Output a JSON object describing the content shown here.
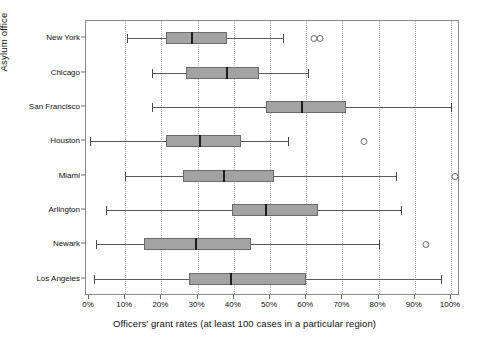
{
  "chart_data": {
    "type": "box",
    "title": "",
    "xlabel": "Officers' grant rates (at least 100 cases in a particular region)",
    "ylabel": "Asylum office",
    "xlim": [
      -2,
      105
    ],
    "xticks": [
      0,
      10,
      20,
      30,
      40,
      50,
      60,
      70,
      80,
      90,
      100
    ],
    "xtick_labels": [
      "0%",
      "10%",
      "20%",
      "30%",
      "40%",
      "50%",
      "60%",
      "70%",
      "80%",
      "90%",
      "100%"
    ],
    "categories": [
      "New York",
      "Chicago",
      "San Francisco",
      "Houston",
      "Miami",
      "Arlington",
      "Newark",
      "Los Angeles"
    ],
    "grid": "vertical-dotted",
    "legend": "none",
    "orientation": "horizontal",
    "units": "percent",
    "boxes": [
      {
        "category": "New York",
        "whisker_low": 10.5,
        "q1": 21.3,
        "median": 28.2,
        "q3": 38.1,
        "whisker_high": 53.6,
        "outliers": [
          62.0,
          63.5
        ]
      },
      {
        "category": "Chicago",
        "whisker_low": 17.4,
        "q1": 26.8,
        "median": 37.8,
        "q3": 47.0,
        "whisker_high": 60.5,
        "outliers": []
      },
      {
        "category": "San Francisco",
        "whisker_low": 17.4,
        "q1": 48.9,
        "median": 58.6,
        "q3": 71.0,
        "whisker_high": 100.0,
        "outliers": []
      },
      {
        "category": "Houston",
        "whisker_low": 0.3,
        "q1": 21.3,
        "median": 30.4,
        "q3": 42.0,
        "whisker_high": 55.0,
        "outliers": [
          75.7
        ]
      },
      {
        "category": "Miami",
        "whisker_low": 9.9,
        "q1": 26.0,
        "median": 37.0,
        "q3": 51.0,
        "whisker_high": 84.8,
        "outliers": [
          100.8
        ]
      },
      {
        "category": "Arlington",
        "whisker_low": 4.7,
        "q1": 39.5,
        "median": 48.6,
        "q3": 63.3,
        "whisker_high": 86.2,
        "outliers": []
      },
      {
        "category": "Newark",
        "whisker_low": 1.9,
        "q1": 15.2,
        "median": 29.3,
        "q3": 44.8,
        "whisker_high": 80.1,
        "outliers": [
          92.8
        ]
      },
      {
        "category": "Los Angeles",
        "whisker_low": 1.4,
        "q1": 27.6,
        "median": 39.0,
        "q3": 60.0,
        "whisker_high": 97.2,
        "outliers": []
      }
    ]
  },
  "colors": {
    "box_fill": "#a3a3a3",
    "box_edge": "#6b6b6b",
    "median": "#1e1e1e",
    "whisker": "#5a5a5a",
    "grid": "#b9b9b9",
    "frame": "#8a8a8a",
    "text": "#111111",
    "background": "#ffffff"
  }
}
